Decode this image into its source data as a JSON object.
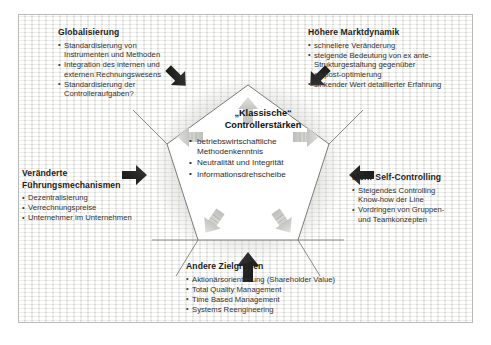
{
  "diagram": {
    "title_center": "„Klassische“",
    "title_center2": "Controllerstärken",
    "core_items": [
      {
        "line1": "betriebswirtschaftliche",
        "line2": "Methodenkenntnis"
      },
      {
        "line1": "Neutralität und Integrität",
        "line2": ""
      },
      {
        "line1": "Informationsdrehscheibe",
        "line2": ""
      }
    ],
    "blocks": [
      {
        "id": "globalisierung",
        "heading": "Globalisierung",
        "items": [
          {
            "line1": "Standardisierung von",
            "line2": "Instrumenten und Methoden"
          },
          {
            "line1": "Integration des internen und",
            "line2": "externen Rechnungswesens"
          },
          {
            "line1": "Standardisierung der",
            "line2": "Controlleraufgaben?"
          }
        ]
      },
      {
        "id": "marktdynamik",
        "heading": "Höhere Marktdynamik",
        "items": [
          {
            "line1": "schnellere Veränderung",
            "line2": "",
            "line3": ""
          },
          {
            "line1": "steigende Bedeutung von ex ante-",
            "line2": "Strukturgestaltung gegenüber",
            "line3": "ex post-optimierung"
          },
          {
            "line1": "sinkender Wert detaillierter Erfahrung",
            "line2": "",
            "line3": ""
          }
        ]
      },
      {
        "id": "fuehrungsmechanismen",
        "heading": "Veränderte",
        "heading2": "Führungsmechanismen",
        "items": [
          {
            "line1": "Dezentralisierung",
            "line2": ""
          },
          {
            "line1": "Verrechnungspreise",
            "line2": ""
          },
          {
            "line1": "Unternehmer im Unternehmen",
            "line2": ""
          }
        ]
      },
      {
        "id": "self-controlling",
        "heading": "Mehr Self-Controlling",
        "items": [
          {
            "line1": "Steigendes Controlling",
            "line2": "Know-how der Line"
          },
          {
            "line1": "Vordringen von Gruppen-",
            "line2": "und Teamkonzepten"
          }
        ]
      },
      {
        "id": "zielgroessen",
        "heading": "Andere Zielgrößen",
        "items": [
          {
            "line1": "Aktionärsorientierung (Shareholder Value)",
            "line2": ""
          },
          {
            "line1": "Total Quality Management",
            "line2": ""
          },
          {
            "line1": "Time Based Management",
            "line2": ""
          },
          {
            "line1": "Systems Reengineering",
            "line2": ""
          }
        ]
      }
    ],
    "colors": {
      "background": "#f2f2f0",
      "frame_border": "#b9b9b9",
      "pentagon_fill": "#ffffff",
      "pentagon_stroke": "#6d6d6a",
      "inward_arrow": "#2a2a2a",
      "outward_arrow": "#c9c9c6",
      "heading_text": "#1d1d1d",
      "body_text": "#333330"
    },
    "arrows_inward": [
      {
        "name": "arrow-inward-top-left"
      },
      {
        "name": "arrow-inward-top-right"
      },
      {
        "name": "arrow-inward-right"
      },
      {
        "name": "arrow-inward-bottom"
      },
      {
        "name": "arrow-inward-left"
      }
    ],
    "arrows_outward": [
      {
        "name": "arrow-outward-top"
      },
      {
        "name": "arrow-outward-right"
      },
      {
        "name": "arrow-outward-bottom-right"
      },
      {
        "name": "arrow-outward-bottom-left"
      },
      {
        "name": "arrow-outward-left"
      }
    ]
  }
}
